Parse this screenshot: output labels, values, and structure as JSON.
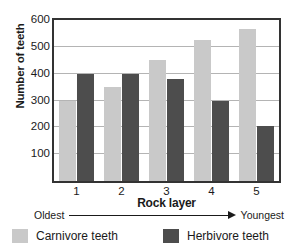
{
  "chart_data": {
    "type": "bar",
    "title": "",
    "xlabel": "Rock layer",
    "ylabel": "Number of teeth",
    "categories": [
      "1",
      "2",
      "3",
      "4",
      "5"
    ],
    "series": [
      {
        "name": "Carnivore teeth",
        "color": "#c9c9c9",
        "values": [
          300,
          350,
          450,
          525,
          565
        ]
      },
      {
        "name": "Herbivore teeth",
        "color": "#4d4d4d",
        "values": [
          400,
          400,
          380,
          300,
          205
        ]
      }
    ],
    "ylim": [
      0,
      600
    ],
    "yticks": [
      100,
      200,
      300,
      400,
      500,
      600
    ],
    "grid": true,
    "legend_position": "bottom",
    "annotations": {
      "axis_direction_left": "Oldest",
      "axis_direction_right": "Youngest"
    }
  },
  "figure": {
    "title_fragment": "",
    "y_axis_title": "Number of teeth",
    "x_axis_title": "Rock layer",
    "y_tick_labels": [
      "600",
      "500",
      "400",
      "300",
      "200",
      "100"
    ],
    "x_tick_labels": [
      "1",
      "2",
      "3",
      "4",
      "5"
    ]
  },
  "age_scale": {
    "left_label": "Oldest",
    "right_label": "Youngest",
    "arrow_icon": "right-arrow-icon"
  },
  "legend": {
    "entries": [
      {
        "label": "Carnivore teeth",
        "color": "#c9c9c9",
        "swatch_icon": "legend-swatch-light"
      },
      {
        "label": "Herbivore teeth",
        "color": "#4d4d4d",
        "swatch_icon": "legend-swatch-dark"
      }
    ]
  },
  "colors": {
    "carnivore": "#c9c9c9",
    "herbivore": "#4d4d4d",
    "axis": "#333333",
    "grid": "#b4b4b4",
    "text": "#1a1a1a",
    "background": "#ffffff"
  }
}
